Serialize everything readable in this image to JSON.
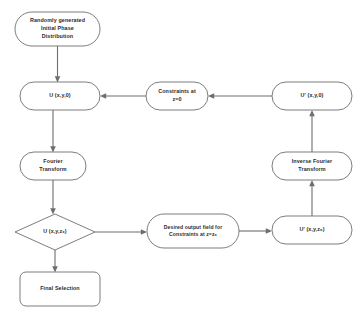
{
  "diagram": {
    "background_color": "#ffffff",
    "stroke_color": "#6e6e6e",
    "text_color": "#2b2b2b",
    "nodes": [
      {
        "id": "start",
        "shape": "stadium",
        "label": "Randomly generated\nInitial  Phase\nDistribution",
        "x": 15,
        "y": 12,
        "w": 85,
        "h": 34
      },
      {
        "id": "u_xy0",
        "shape": "stadium",
        "label": "U (x,y,0)",
        "x": 20,
        "y": 82,
        "w": 80,
        "h": 28
      },
      {
        "id": "constraints_z0",
        "shape": "stadium",
        "label": "Constraints at\nz=0",
        "x": 146,
        "y": 82,
        "w": 62,
        "h": 28
      },
      {
        "id": "uprime_xy0",
        "shape": "stadium",
        "label": "U' (x,y,0)",
        "x": 272,
        "y": 82,
        "w": 80,
        "h": 28
      },
      {
        "id": "fourier",
        "shape": "stadium",
        "label": "Fourier\nTransform",
        "x": 20,
        "y": 152,
        "w": 66,
        "h": 28
      },
      {
        "id": "inverse_fourier",
        "shape": "stadium",
        "label": "Inverse Fourier\nTransform",
        "x": 272,
        "y": 152,
        "w": 80,
        "h": 28
      },
      {
        "id": "u_xyz0",
        "shape": "diamond",
        "label": "U (x,y,z₀)",
        "x": 15,
        "y": 214,
        "w": 80,
        "h": 36
      },
      {
        "id": "desired_output",
        "shape": "stadium",
        "label": "Desired output field for\nConstraints at z=z₀",
        "x": 147,
        "y": 214,
        "w": 92,
        "h": 34
      },
      {
        "id": "uprime_xyz0",
        "shape": "stadium",
        "label": "U' (x,y,z₀)",
        "x": 272,
        "y": 216,
        "w": 80,
        "h": 28
      },
      {
        "id": "final_selection",
        "shape": "rounded-rect",
        "label": "Final Selection",
        "x": 20,
        "y": 272,
        "w": 80,
        "h": 34
      }
    ],
    "edges": [
      {
        "id": "start-to-u",
        "from": "start",
        "to": "u_xy0",
        "direction": "down"
      },
      {
        "id": "uprime0-to-constraints",
        "from": "uprime_xy0",
        "to": "constraints_z0",
        "direction": "left"
      },
      {
        "id": "constraints-to-u",
        "from": "constraints_z0",
        "to": "u_xy0",
        "direction": "left"
      },
      {
        "id": "u-to-fourier",
        "from": "u_xy0",
        "to": "fourier",
        "direction": "down"
      },
      {
        "id": "fourier-to-uz0",
        "from": "fourier",
        "to": "u_xyz0",
        "direction": "down"
      },
      {
        "id": "uz0-to-desired",
        "from": "u_xyz0",
        "to": "desired_output",
        "direction": "right"
      },
      {
        "id": "desired-to-uprimez0",
        "from": "desired_output",
        "to": "uprime_xyz0",
        "direction": "right"
      },
      {
        "id": "uprimez0-to-inverse",
        "from": "uprime_xyz0",
        "to": "inverse_fourier",
        "direction": "up"
      },
      {
        "id": "inverse-to-uprime0",
        "from": "inverse_fourier",
        "to": "uprime_xy0",
        "direction": "up"
      },
      {
        "id": "uz0-to-final",
        "from": "u_xyz0",
        "to": "final_selection",
        "direction": "down"
      }
    ]
  }
}
